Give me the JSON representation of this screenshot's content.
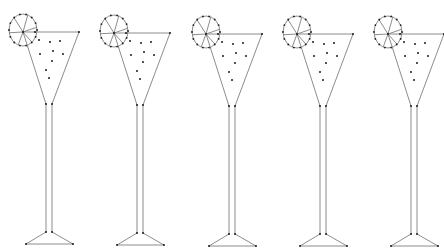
{
  "scene": {
    "description": "Five identical line-drawn cocktail glasses with lemon slice garnish",
    "background": "#ffffff",
    "line_color": "#6e6e6e",
    "point_color": "#1a1a1a",
    "glass_count": 5
  },
  "glass_template": {
    "lemon": {
      "cx": 0,
      "cy": 0,
      "rx": 14,
      "ry": 16,
      "segments": 6
    },
    "rim": {
      "left_x": 0,
      "right_x": 56,
      "y": 0
    },
    "bowl_bottom": {
      "left_x": 23,
      "right_x": 29,
      "y": 72
    },
    "stem": {
      "left_x": 23,
      "right_x": 29,
      "top_y": 72,
      "bottom_y": 200
    },
    "base": {
      "left_x": 3,
      "right_x": 50,
      "y": 212
    },
    "bubbles": [
      [
        16,
        8
      ],
      [
        27,
        10
      ],
      [
        37,
        9
      ],
      [
        17,
        22
      ],
      [
        30,
        19
      ],
      [
        40,
        22
      ],
      [
        29,
        29
      ],
      [
        23,
        38
      ],
      [
        26,
        46
      ]
    ]
  },
  "glasses": [
    {
      "id": 1,
      "origin_x": 23,
      "origin_y": 32
    },
    {
      "id": 2,
      "origin_x": 114,
      "origin_y": 33
    },
    {
      "id": 3,
      "origin_x": 206,
      "origin_y": 34
    },
    {
      "id": 4,
      "origin_x": 297,
      "origin_y": 34
    },
    {
      "id": 5,
      "origin_x": 388,
      "origin_y": 34
    }
  ]
}
